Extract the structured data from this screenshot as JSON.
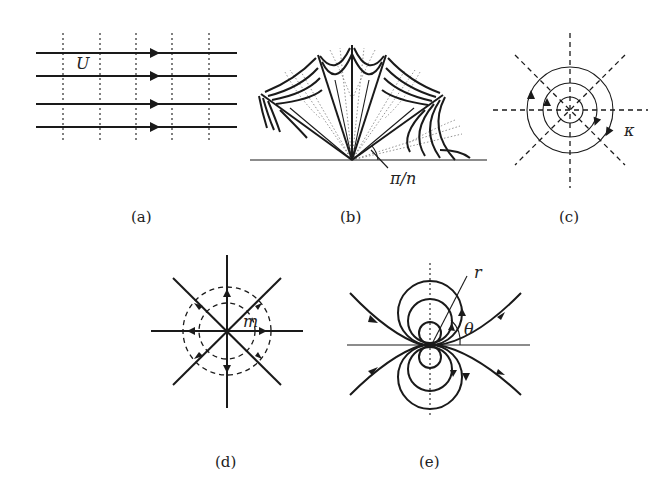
{
  "figure": {
    "panels": [
      {
        "id": "a",
        "caption": "(a)",
        "title": "Uniform flow",
        "symbol": "U"
      },
      {
        "id": "b",
        "caption": "(b)",
        "title": "Flow in a corner / wedge",
        "symbol": "π/n"
      },
      {
        "id": "c",
        "caption": "(c)",
        "title": "Point vortex",
        "symbol": "κ"
      },
      {
        "id": "d",
        "caption": "(d)",
        "title": "Source",
        "symbol": "m"
      },
      {
        "id": "e",
        "caption": "(e)",
        "title": "Dipole / doublet",
        "symbol_r": "r",
        "symbol_theta": "θ"
      }
    ]
  },
  "colors": {
    "ink": "#1a1a1a",
    "faint": "#777777",
    "background": "#ffffff"
  }
}
